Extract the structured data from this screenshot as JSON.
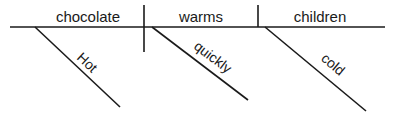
{
  "diagram": {
    "type": "reed-kellogg-sentence-diagram",
    "sentence": "Hot chocolate warms cold children quickly.",
    "colors": {
      "ink": "#1a1a1a",
      "background": "#ffffff"
    },
    "baseline": {
      "x1": 10,
      "y1": 27,
      "x2": 385,
      "y2": 27
    },
    "dividers": [
      {
        "name": "subject-verb-divider",
        "x": 144,
        "y1": 5,
        "y2": 52
      },
      {
        "name": "verb-object-divider",
        "x": 258,
        "y1": 5,
        "y2": 27
      }
    ],
    "baseline_words": [
      {
        "label": "chocolate",
        "role": "subject",
        "cx": 88,
        "cy": 22
      },
      {
        "label": "warms",
        "role": "verb",
        "cx": 201,
        "cy": 22
      },
      {
        "label": "children",
        "role": "direct-object",
        "cx": 320,
        "cy": 22
      }
    ],
    "modifiers": [
      {
        "label": "Hot",
        "role": "adjective-modifying-subject",
        "line": {
          "x1": 35,
          "y1": 27,
          "x2": 120,
          "y2": 107
        },
        "text": {
          "cx": 84,
          "cy": 66,
          "rotation": 43
        }
      },
      {
        "label": "quickly",
        "role": "adverb-modifying-verb",
        "line": {
          "x1": 152,
          "y1": 27,
          "x2": 248,
          "y2": 100
        },
        "text": {
          "cx": 210,
          "cy": 61,
          "rotation": 37
        }
      },
      {
        "label": "cold",
        "role": "adjective-modifying-object",
        "line": {
          "x1": 265,
          "y1": 27,
          "x2": 366,
          "y2": 111
        },
        "text": {
          "cx": 330,
          "cy": 68,
          "rotation": 40
        }
      }
    ]
  }
}
